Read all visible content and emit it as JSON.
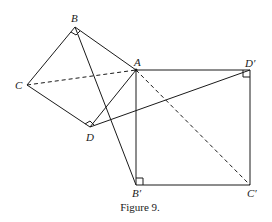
{
  "figure": {
    "caption": "Figure 9.",
    "stroke_color": "#1a1a1a",
    "points": {
      "A": {
        "label": "A",
        "x": 136,
        "y": 70
      },
      "B": {
        "label": "B",
        "x": 75,
        "y": 27
      },
      "C": {
        "label": "C",
        "x": 27,
        "y": 85
      },
      "D": {
        "label": "D",
        "x": 90,
        "y": 127
      },
      "Dp": {
        "label": "D′",
        "x": 250,
        "y": 70
      },
      "Bp": {
        "label": "B′",
        "x": 136,
        "y": 185
      },
      "Cp": {
        "label": "C′",
        "x": 250,
        "y": 185
      }
    },
    "solid_segments": [
      [
        "B",
        "C"
      ],
      [
        "C",
        "D"
      ],
      [
        "D",
        "A"
      ],
      [
        "A",
        "B"
      ],
      [
        "A",
        "Dp"
      ],
      [
        "Dp",
        "Cp"
      ],
      [
        "Cp",
        "Bp"
      ],
      [
        "Bp",
        "A"
      ],
      [
        "B",
        "Bp"
      ],
      [
        "D",
        "Dp"
      ]
    ],
    "dashed_segments": [
      [
        "C",
        "A"
      ],
      [
        "A",
        "Cp"
      ]
    ],
    "right_angle_marks": [
      "B",
      "D",
      "Dp",
      "Bp"
    ]
  }
}
